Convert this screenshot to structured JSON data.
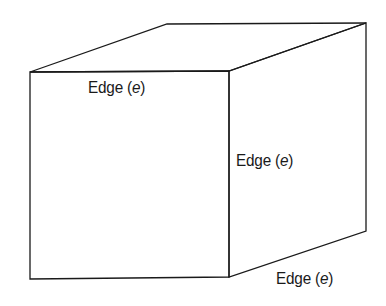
{
  "diagram": {
    "line_color": "#1a1a1a",
    "labels": {
      "top_edge": {
        "prefix": "Edge (",
        "var": "e",
        "suffix": ")"
      },
      "right_edge": {
        "prefix": "Edge (",
        "var": "e",
        "suffix": ")"
      },
      "depth_edge": {
        "prefix": "Edge (",
        "var": "e",
        "suffix": ")"
      }
    }
  }
}
